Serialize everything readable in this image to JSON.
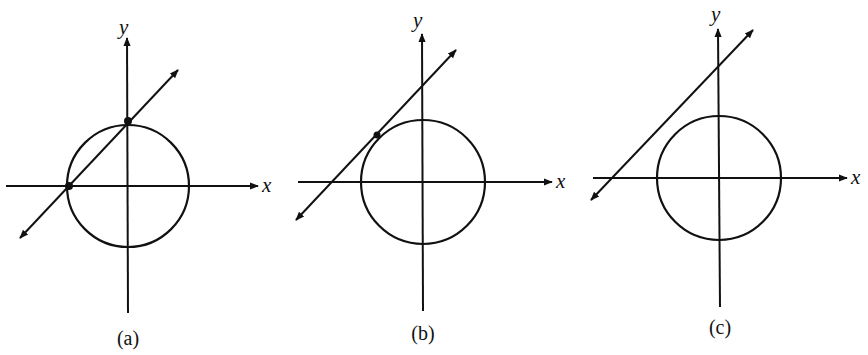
{
  "figure": {
    "panels": [
      {
        "id": "a",
        "caption": "(a)",
        "x_label": "x",
        "y_label": "y",
        "relationship": "line intersects circle at two points",
        "intersection_points": 2
      },
      {
        "id": "b",
        "caption": "(b)",
        "x_label": "x",
        "y_label": "y",
        "relationship": "line tangent to circle at one point",
        "intersection_points": 1
      },
      {
        "id": "c",
        "caption": "(c)",
        "x_label": "x",
        "y_label": "y",
        "relationship": "line does not intersect circle",
        "intersection_points": 0
      }
    ],
    "colors": {
      "stroke": "#111111",
      "background": "#ffffff"
    }
  }
}
